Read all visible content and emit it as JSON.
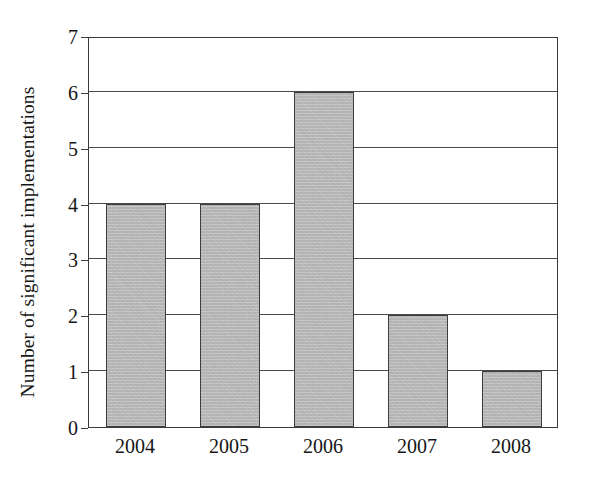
{
  "chart_data": {
    "type": "bar",
    "title": "",
    "xlabel": "",
    "ylabel": "Number of significant implementations",
    "categories": [
      "2004",
      "2005",
      "2006",
      "2007",
      "2008"
    ],
    "values": [
      4,
      4,
      6,
      2,
      1
    ],
    "ylim": [
      0,
      7
    ],
    "ytick_labels": [
      "0",
      "1",
      "2",
      "3",
      "4",
      "5",
      "6",
      "7"
    ],
    "ytick_values": [
      0,
      1,
      2,
      3,
      4,
      5,
      6,
      7
    ],
    "grid": "horizontal",
    "legend": "none",
    "bar_fill_color": "#b4b4b4",
    "bar_border_color": "#3d3d3d",
    "axis_color": "#3b3b3b",
    "background_color": "#ffffff"
  }
}
